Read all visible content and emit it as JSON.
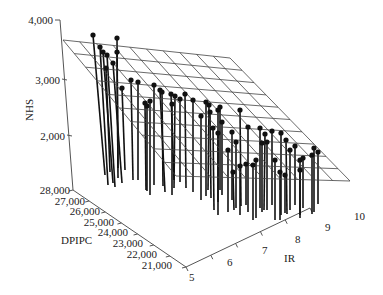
{
  "chart_data": {
    "type": "scatter3d",
    "title": "",
    "zlabel": "NHS",
    "xlabel": "IR",
    "ylabel": "DPIPC",
    "z_ticks": [
      "2,000",
      "3,000",
      "4,000"
    ],
    "x_ticks": [
      "5",
      "6",
      "7",
      "8",
      "9",
      "10"
    ],
    "y_ticks": [
      "21,000",
      "22,000",
      "23,000",
      "24,000",
      "25,000",
      "26,000",
      "27,000",
      "28,000"
    ],
    "zlim": [
      1300,
      4000
    ],
    "xlim": [
      5,
      10
    ],
    "ylim": [
      21000,
      28000
    ],
    "grid": false,
    "fitted_plane": true,
    "plane_grid_lines": 10,
    "colors": {
      "axis": "#555555",
      "stem": "#111111",
      "plane": "#444444",
      "point": "#111111"
    },
    "points_screen": [
      [
        93,
        35,
        105,
        175
      ],
      [
        100,
        47,
        108,
        185
      ],
      [
        103,
        52,
        113,
        183
      ],
      [
        107,
        55,
        115,
        187
      ],
      [
        113,
        63,
        122,
        183
      ],
      [
        117,
        38,
        118,
        178
      ],
      [
        117,
        52,
        118,
        168
      ],
      [
        106,
        68,
        110,
        172
      ],
      [
        131,
        80,
        133,
        180
      ],
      [
        138,
        82,
        138,
        180
      ],
      [
        122,
        88,
        125,
        170
      ],
      [
        154,
        85,
        154,
        185
      ],
      [
        160,
        90,
        165,
        192
      ],
      [
        162,
        92,
        163,
        186
      ],
      [
        171,
        94,
        174,
        180
      ],
      [
        175,
        96,
        174,
        188
      ],
      [
        180,
        99,
        180,
        182
      ],
      [
        185,
        94,
        186,
        188
      ],
      [
        193,
        100,
        193,
        192
      ],
      [
        172,
        104,
        172,
        195
      ],
      [
        206,
        102,
        206,
        196
      ],
      [
        209,
        105,
        208,
        190
      ],
      [
        201,
        116,
        201,
        200
      ],
      [
        210,
        112,
        211,
        198
      ],
      [
        218,
        110,
        218,
        202
      ],
      [
        220,
        107,
        220,
        190
      ],
      [
        222,
        122,
        222,
        195
      ],
      [
        213,
        128,
        214,
        210
      ],
      [
        218,
        133,
        218,
        215
      ],
      [
        232,
        132,
        232,
        200
      ],
      [
        150,
        101,
        150,
        195
      ],
      [
        145,
        103,
        146,
        190
      ],
      [
        147,
        106,
        147,
        191
      ],
      [
        240,
        110,
        241,
        206
      ],
      [
        248,
        127,
        248,
        212
      ],
      [
        260,
        128,
        260,
        208
      ],
      [
        265,
        134,
        264,
        210
      ],
      [
        262,
        143,
        262,
        212
      ],
      [
        272,
        131,
        272,
        205
      ],
      [
        267,
        142,
        267,
        210
      ],
      [
        281,
        133,
        281,
        215
      ],
      [
        286,
        140,
        287,
        214
      ],
      [
        275,
        160,
        275,
        220
      ],
      [
        290,
        150,
        290,
        210
      ],
      [
        295,
        146,
        295,
        205
      ],
      [
        300,
        160,
        300,
        215
      ],
      [
        303,
        158,
        303,
        208
      ],
      [
        312,
        155,
        312,
        214
      ],
      [
        318,
        152,
        318,
        204
      ],
      [
        314,
        148,
        314,
        212
      ],
      [
        256,
        160,
        256,
        218
      ],
      [
        253,
        165,
        253,
        220
      ],
      [
        246,
        164,
        246,
        205
      ],
      [
        240,
        166,
        240,
        215
      ],
      [
        236,
        142,
        236,
        208
      ],
      [
        228,
        150,
        228,
        212
      ],
      [
        233,
        172,
        234,
        210
      ],
      [
        285,
        175,
        285,
        213
      ],
      [
        280,
        172,
        280,
        220
      ],
      [
        300,
        170,
        300,
        218
      ]
    ]
  },
  "labels": {
    "z_axis": "NHS",
    "x_axis": "IR",
    "y_axis": "DPIPC"
  }
}
